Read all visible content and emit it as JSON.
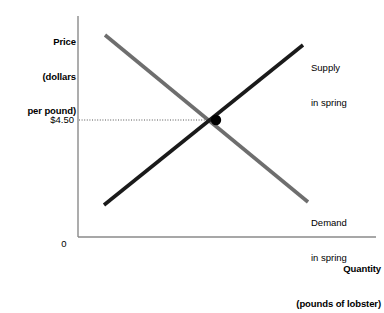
{
  "chart_data": {
    "type": "line",
    "title": "",
    "subtitle": "",
    "ylabel_lines": [
      "Price",
      "(dollars",
      "per pound)"
    ],
    "xlabel_lines": [
      "Quantity",
      "(pounds of lobster)"
    ],
    "ylabel": "Price (dollars per pound)",
    "xlabel": "Quantity (pounds of lobster)",
    "grid": false,
    "legend_position": "inline-right",
    "origin_label": "0",
    "y_ticks": [
      {
        "label": "$4.50",
        "value": 4.5,
        "leader": "dotted"
      }
    ],
    "x_ticks": [],
    "annotations": [
      {
        "name": "equilibrium-point",
        "marker": "filled-circle",
        "price": 4.5,
        "label": "$4.50"
      }
    ],
    "series": [
      {
        "name": "Supply in spring",
        "label_lines": [
          "Supply",
          "in spring"
        ],
        "color": "#1a1a1a",
        "width": 3.6,
        "slope": "upward",
        "points": [
          {
            "x": 104,
            "y": 205
          },
          {
            "x": 303,
            "y": 45
          }
        ]
      },
      {
        "name": "Demand in spring",
        "label_lines": [
          "Demand",
          "in spring"
        ],
        "color": "#6e6e6e",
        "width": 3.6,
        "slope": "downward",
        "points": [
          {
            "x": 105,
            "y": 35
          },
          {
            "x": 308,
            "y": 202
          }
        ]
      }
    ],
    "axes": {
      "color": "#8a8a8a",
      "y_axis": {
        "x": 78,
        "y1": 16,
        "y2": 237
      },
      "x_axis": {
        "y": 237,
        "x1": 78,
        "x2": 376
      }
    },
    "equilibrium": {
      "x": 216,
      "y": 120
    }
  },
  "colors": {
    "supply": "#1a1a1a",
    "demand": "#6e6e6e",
    "axis": "#8a8a8a",
    "text": "#000000",
    "background": "#ffffff",
    "leader": "#555555"
  }
}
